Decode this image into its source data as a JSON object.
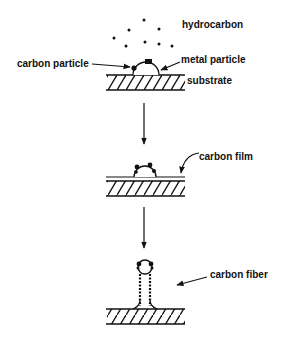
{
  "diagram": {
    "title": "",
    "stages": [
      {
        "id": "stage-1",
        "labels": {
          "hydrocarbon": "hydrocarbon",
          "carbon_particle": "carbon particle",
          "metal_particle": "metal particle",
          "substrate": "substrate"
        }
      },
      {
        "id": "stage-2",
        "labels": {
          "carbon_film": "carbon film"
        }
      },
      {
        "id": "stage-3",
        "labels": {
          "carbon_fiber": "carbon fiber"
        }
      }
    ],
    "colors": {
      "ink": "#111111",
      "background": "#ffffff"
    }
  }
}
